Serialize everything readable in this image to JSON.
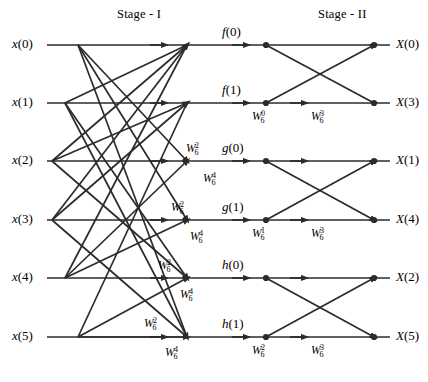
{
  "figure": {
    "type": "signal-flow-graph",
    "name": "6-point DFT decimation-in-time flow graph",
    "width": 428,
    "height": 382,
    "line_color": "#2b2b2b",
    "text_color": "#000000",
    "background": "#ffffff"
  },
  "stages": {
    "stage1_title": "Stage - I",
    "stage2_title": "Stage - II"
  },
  "inputs": [
    {
      "name": "x",
      "index": "(0)",
      "y": 45
    },
    {
      "name": "x",
      "index": "(1)",
      "y": 103
    },
    {
      "name": "x",
      "index": "(2)",
      "y": 161
    },
    {
      "name": "x",
      "index": "(3)",
      "y": 220
    },
    {
      "name": "x",
      "index": "(4)",
      "y": 278
    },
    {
      "name": "x",
      "index": "(5)",
      "y": 337
    }
  ],
  "intermediates": [
    {
      "name": "f",
      "index": "(0)",
      "y": 45
    },
    {
      "name": "f",
      "index": "(1)",
      "y": 103
    },
    {
      "name": "g",
      "index": "(0)",
      "y": 161
    },
    {
      "name": "g",
      "index": "(1)",
      "y": 220
    },
    {
      "name": "h",
      "index": "(0)",
      "y": 278
    },
    {
      "name": "h",
      "index": "(1)",
      "y": 337
    }
  ],
  "outputs": [
    {
      "name": "X",
      "index": "(0)",
      "y": 45
    },
    {
      "name": "X",
      "index": "(3)",
      "y": 103
    },
    {
      "name": "X",
      "index": "(1)",
      "y": 161
    },
    {
      "name": "X",
      "index": "(4)",
      "y": 220
    },
    {
      "name": "X",
      "index": "(2)",
      "y": 278
    },
    {
      "name": "X",
      "index": "(5)",
      "y": 337
    }
  ],
  "twiddle_base": "W",
  "twiddle_subscript": "6",
  "stage1_twiddles": [
    {
      "exp": "2",
      "x": 186,
      "y": 150
    },
    {
      "exp": "4",
      "x": 203,
      "y": 180
    },
    {
      "exp": "2",
      "x": 171,
      "y": 209
    },
    {
      "exp": "4",
      "x": 190,
      "y": 238
    },
    {
      "exp": "2",
      "x": 158,
      "y": 267
    },
    {
      "exp": "4",
      "x": 180,
      "y": 296
    },
    {
      "exp": "2",
      "x": 144,
      "y": 325
    },
    {
      "exp": "4",
      "x": 165,
      "y": 354
    }
  ],
  "stage2_twiddles": [
    {
      "exp": "0",
      "x": 276,
      "y": 118
    },
    {
      "exp": "3",
      "x": 333,
      "y": 118
    },
    {
      "exp": "1",
      "x": 276,
      "y": 235
    },
    {
      "exp": "3",
      "x": 333,
      "y": 235
    },
    {
      "exp": "2",
      "x": 276,
      "y": 352
    },
    {
      "exp": "3",
      "x": 333,
      "y": 352
    }
  ],
  "geometry": {
    "row_y": [
      45,
      103,
      161,
      220,
      278,
      337
    ],
    "input_line_start": 47,
    "stage1_merge_x": 187,
    "stage2_line_end": 390,
    "stage1_branch_x": [
      78,
      65,
      52,
      52,
      65,
      78
    ],
    "stage2_node_x": [
      266,
      320,
      374
    ],
    "butterfly_pairs": [
      [
        0,
        1
      ],
      [
        2,
        3
      ],
      [
        4,
        5
      ]
    ]
  }
}
